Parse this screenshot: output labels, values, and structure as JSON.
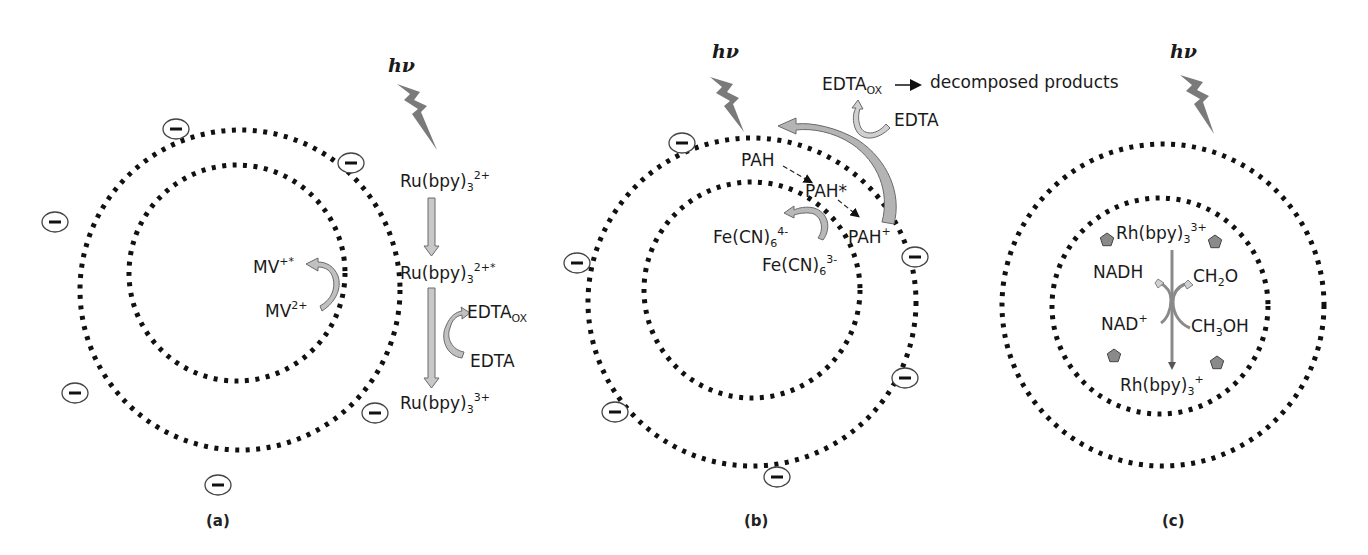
{
  "colors": {
    "dots": "#111111",
    "arrow_fill": "#b8b8b8",
    "arrow_stroke": "#6a6a6a",
    "lightning": "#7a7a7a",
    "pentagon": "#8a8a8a",
    "text": "#1a1a1a"
  },
  "panels": [
    {
      "id": "a",
      "label": "(a)",
      "hv": "hν",
      "outer_circle": {
        "cx": 240,
        "cy": 290,
        "r": 160
      },
      "inner_circle": {
        "cx": 237,
        "cy": 273,
        "r": 108
      },
      "charges": [
        [
          176,
          129
        ],
        [
          351,
          163
        ],
        [
          55,
          222
        ],
        [
          75,
          393
        ],
        [
          375,
          413
        ],
        [
          218,
          485
        ]
      ],
      "charge_symbol": "−",
      "species": {
        "mv_plus": {
          "base": "MV",
          "sup": "+*"
        },
        "mv_2plus": {
          "base": "MV",
          "sup": "2+"
        },
        "ru_2plus": {
          "base": "Ru(bpy)",
          "sub": "3",
          "sup": "2+"
        },
        "ru_2plus_star": {
          "base": "Ru(bpy)",
          "sub": "3",
          "sup": "2+*"
        },
        "edta_ox": {
          "base": "EDTA",
          "sub": "OX"
        },
        "edta": {
          "base": "EDTA"
        },
        "ru_3plus": {
          "base": "Ru(bpy)",
          "sub": "3",
          "sup": "3+"
        }
      }
    },
    {
      "id": "b",
      "label": "(b)",
      "hv": "hν",
      "outer_circle": {
        "cx": 752,
        "cy": 302,
        "r": 164
      },
      "inner_circle": {
        "cx": 752,
        "cy": 290,
        "r": 108
      },
      "charges": [
        [
          682,
          143
        ],
        [
          577,
          263
        ],
        [
          915,
          257
        ],
        [
          905,
          378
        ],
        [
          615,
          412
        ],
        [
          777,
          477
        ]
      ],
      "charge_symbol": "−",
      "species": {
        "edta_ox": {
          "base": "EDTA",
          "sub": "OX"
        },
        "decomposed": "decomposed products",
        "edta": {
          "base": "EDTA"
        },
        "pah": {
          "base": "PAH"
        },
        "pah_star": {
          "base": "PAH*"
        },
        "pah_plus": {
          "base": "PAH",
          "sup": "+"
        },
        "fe_4minus": {
          "base": "Fe(CN)",
          "sub": "6",
          "sup": "4-"
        },
        "fe_3minus": {
          "base": "Fe(CN)",
          "sub": "6",
          "sup": "3-"
        }
      }
    },
    {
      "id": "c",
      "label": "(c)",
      "hv": "hν",
      "outer_circle": {
        "cx": 1163,
        "cy": 305,
        "r": 161
      },
      "inner_circle": {
        "cx": 1160,
        "cy": 306,
        "r": 108
      },
      "charges": [],
      "species": {
        "rh_3plus": {
          "base": "Rh(bpy)",
          "sub": "3",
          "sup": "3+"
        },
        "nadh": {
          "base": "NADH"
        },
        "ch2o": {
          "base": "CH",
          "sub": "2",
          "tail": "O"
        },
        "nad_plus": {
          "base": "NAD",
          "sup": "+"
        },
        "ch3oh": {
          "base": "CH",
          "sub": "3",
          "tail": "OH"
        },
        "rh_plus": {
          "base": "Rh(bpy)",
          "sub": "3",
          "sup": "+"
        }
      },
      "pentagons": [
        [
          1107,
          240
        ],
        [
          1215,
          242
        ],
        [
          1114,
          356
        ],
        [
          1217,
          363
        ]
      ]
    }
  ]
}
